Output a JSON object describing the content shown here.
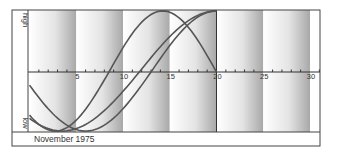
{
  "chart_data": {
    "type": "line",
    "title": "",
    "caption": "November 1975",
    "xlabel": "",
    "ylabel_top": "high",
    "ylabel_bottom": "low",
    "x_ticks": [
      5,
      10,
      15,
      20,
      25,
      30
    ],
    "xlim": [
      0,
      31
    ],
    "ylim": [
      -1,
      1
    ],
    "grid": false,
    "bands": "alternating 5-day gradient bands (white to grey)",
    "marker_day": 20,
    "series": [
      {
        "name": "curve-a",
        "period_days": 23,
        "peak_day": 14.25,
        "x": [
          0,
          2.5,
          5,
          7.5,
          10,
          12.5,
          14.25,
          17.5,
          20
        ],
        "values": [
          -0.76,
          -0.99,
          -0.86,
          -0.38,
          0.27,
          0.82,
          1.0,
          0.7,
          0.0
        ]
      },
      {
        "name": "curve-b",
        "period_days": 28,
        "peak_day": 20,
        "x": [
          0,
          2.5,
          6,
          10,
          13,
          16,
          20
        ],
        "values": [
          -0.78,
          -0.97,
          -0.97,
          -0.43,
          0.22,
          0.78,
          1.0
        ]
      },
      {
        "name": "curve-c",
        "period_days": 33,
        "peak_day": 20,
        "x": [
          0,
          3.5,
          7,
          10,
          13,
          16,
          20
        ],
        "values": [
          -0.54,
          -0.95,
          -1.0,
          -0.58,
          0.01,
          0.6,
          1.0
        ]
      }
    ],
    "colors": {
      "curve": "#555555",
      "frame": "#444444",
      "band_dark": "#9a9a9a"
    }
  }
}
